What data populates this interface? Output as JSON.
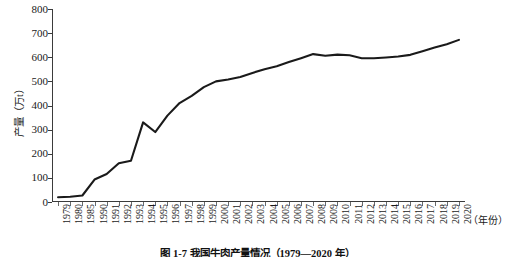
{
  "chart_data": {
    "type": "line",
    "title": "",
    "caption": "图 1-7  我国牛肉产量情况（1979—2020 年）",
    "xlabel": "（年份）",
    "ylabel": "产量（万t）",
    "ylim": [
      0,
      800
    ],
    "ytick_step": 100,
    "yticks": [
      "800",
      "700",
      "600",
      "500",
      "400",
      "300",
      "200",
      "100",
      "0"
    ],
    "grid": false,
    "legend": "none",
    "line_color": "#1a1a1a",
    "line_width": 2.1,
    "categories": [
      "1979",
      "1980",
      "1985",
      "1990",
      "1991",
      "1992",
      "1993",
      "1994",
      "1995",
      "1996",
      "1997",
      "1998",
      "1999",
      "2000",
      "2001",
      "2002",
      "2003",
      "2004",
      "2005",
      "2006",
      "2007",
      "2008",
      "2009",
      "2010",
      "2011",
      "2012",
      "2013",
      "2014",
      "2015",
      "2016",
      "2017",
      "2018",
      "2019",
      "2020"
    ],
    "values": [
      20,
      22,
      27,
      93,
      116,
      161,
      171,
      330,
      290,
      358,
      410,
      440,
      476,
      500,
      508,
      518,
      535,
      550,
      563,
      580,
      596,
      613,
      606,
      611,
      608,
      596,
      596,
      599,
      603,
      610,
      625,
      640,
      654,
      672
    ]
  }
}
